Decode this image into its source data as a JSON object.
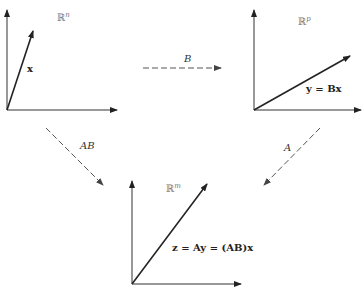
{
  "diagram": {
    "type": "composition-of-linear-maps",
    "spaces": {
      "domain": {
        "symbol": "ℝ",
        "superscript": "n",
        "vector_label": "x"
      },
      "intermediate": {
        "symbol": "ℝ",
        "superscript": "p",
        "vector_label": "y = Bx"
      },
      "codomain": {
        "symbol": "ℝ",
        "superscript": "m",
        "vector_label": "z = Ay = (AB)x"
      }
    },
    "maps": {
      "B": {
        "label": "B",
        "from": "ℝⁿ",
        "to": "ℝᵖ"
      },
      "A": {
        "label": "A",
        "from": "ℝᵖ",
        "to": "ℝᵐ"
      },
      "AB": {
        "label": "AB",
        "from": "ℝⁿ",
        "to": "ℝᵐ"
      }
    },
    "colors": {
      "axes": "#333333",
      "vector": "#222222",
      "dashed_arrow": "#555555",
      "space_label": "#777777"
    }
  }
}
